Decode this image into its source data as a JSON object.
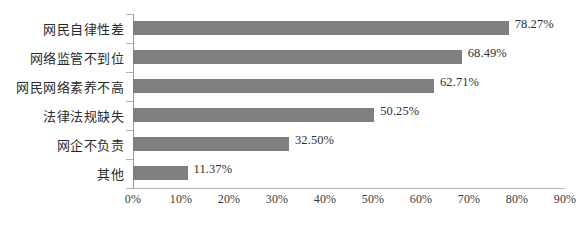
{
  "chart_data": {
    "type": "bar",
    "orientation": "horizontal",
    "title": "",
    "xlabel": "",
    "ylabel": "",
    "xlim": [
      0,
      90
    ],
    "grid": false,
    "legend": null,
    "bar_color": "#808080",
    "categories": [
      "网民自律性差",
      "网络监管不到位",
      "网民网络素养不高",
      "法律法规缺失",
      "网企不负责",
      "其他"
    ],
    "values": [
      78.27,
      68.49,
      62.71,
      50.25,
      32.5,
      11.37
    ],
    "value_labels": [
      "78.27%",
      "68.49%",
      "62.71%",
      "50.25%",
      "32.50%",
      "11.37%"
    ],
    "xticks": [
      0,
      10,
      20,
      30,
      40,
      50,
      60,
      70,
      80,
      90
    ],
    "xtick_labels": [
      "0%",
      "10%",
      "20%",
      "30%",
      "40%",
      "50%",
      "60%",
      "70%",
      "80%",
      "90%"
    ]
  }
}
